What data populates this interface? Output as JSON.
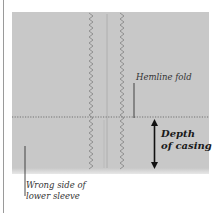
{
  "diagram": {
    "fabric_color": "#c8c8c8",
    "stitch_color": "#8a8a8a",
    "labels": {
      "hemline_fold": "Hemline fold",
      "depth_line1": "Depth",
      "depth_line2": "of casing",
      "wrong_side_line1": "Wrong side of",
      "wrong_side_line2": "lower sleeve"
    }
  }
}
